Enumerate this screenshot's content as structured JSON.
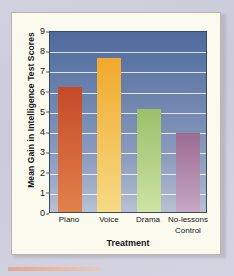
{
  "chart_data": {
    "type": "bar",
    "title": "",
    "subtitle": "",
    "xlabel": "Treatment",
    "ylabel": "Mean Gain in Intelligence Test Scores",
    "categories": [
      "Piano",
      "Voice",
      "Drama",
      "No-lessons Control"
    ],
    "category_lines": [
      [
        "Piano"
      ],
      [
        "Voice"
      ],
      [
        "Drama"
      ],
      [
        "No-lessons",
        "Control"
      ]
    ],
    "values": [
      6.2,
      7.6,
      5.1,
      3.9
    ],
    "bar_colors": [
      "#c44a28",
      "#f0a92c",
      "#9bc06a",
      "#9c6b93"
    ],
    "bar_colors_bottom": [
      "#e2814a",
      "#f7da86",
      "#cde3a4",
      "#c5a7c4"
    ],
    "ylim": [
      0,
      9
    ],
    "ytick_values": [
      0,
      1,
      2,
      3,
      4,
      5,
      6,
      7,
      8,
      9
    ],
    "ytick_labels": [
      "0",
      "1",
      "2",
      "3",
      "4",
      "5",
      "6",
      "7",
      "8",
      "9"
    ],
    "grid": true,
    "grid_color": "#ffffff",
    "legend": "none",
    "plot_background": "blue-vertical-gradient",
    "figure_background": "#fbfaef",
    "page_background": "#cfcede"
  }
}
